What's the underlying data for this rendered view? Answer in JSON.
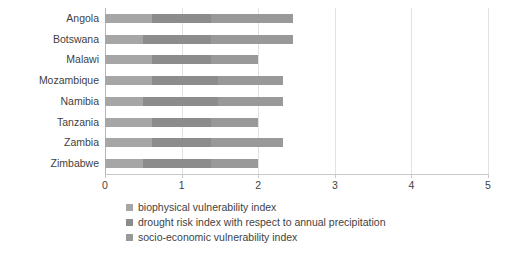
{
  "chart_data": {
    "type": "bar",
    "orientation": "horizontal",
    "stacked": true,
    "title": "",
    "xlabel": "",
    "ylabel": "",
    "xlim": [
      0,
      5
    ],
    "ylim": null,
    "grid": true,
    "legend_position": "bottom",
    "xticks": [
      "0",
      "1",
      "2",
      "3",
      "4",
      "5"
    ],
    "xtick_values": [
      0,
      1,
      2,
      3,
      4,
      5
    ],
    "categories": [
      "Angola",
      "Botswana",
      "Malawi",
      "Mozambique",
      "Namibia",
      "Tanzania",
      "Zambia",
      "Zimbabwe"
    ],
    "series": [
      {
        "name": "biophysical vulnerability index",
        "color": "#a6a6a6",
        "values": [
          0.62,
          0.5,
          0.62,
          0.62,
          0.5,
          0.62,
          0.62,
          0.5
        ]
      },
      {
        "name": "drought risk index with respect to annual precipitation",
        "color": "#8c8c8c",
        "values": [
          0.76,
          0.88,
          0.76,
          0.86,
          0.98,
          0.76,
          0.76,
          0.88
        ]
      },
      {
        "name": "socio-economic vulnerability index",
        "color": "#999999",
        "values": [
          1.07,
          1.07,
          0.62,
          0.85,
          0.85,
          0.62,
          0.95,
          0.62
        ]
      }
    ],
    "totals": [
      2.45,
      2.45,
      2.0,
      2.33,
      2.33,
      2.0,
      2.33,
      2.0
    ]
  },
  "legend": {
    "items": [
      {
        "label": "biophysical vulnerability index",
        "color": "#a6a6a6"
      },
      {
        "label": "drought risk index with respect to annual precipitation",
        "color": "#8c8c8c"
      },
      {
        "label": "socio-economic vulnerability index",
        "color": "#999999"
      }
    ]
  },
  "colors": {
    "gridline": "#e2e2e2",
    "axis": "#c9c9c9",
    "text": "#3f3f3f",
    "background": "#ffffff"
  }
}
